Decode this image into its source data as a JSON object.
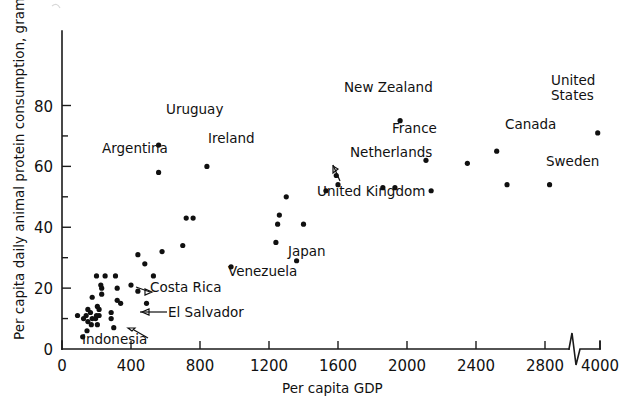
{
  "chart_data": {
    "type": "scatter",
    "title": "",
    "xlabel": "Per capita GDP",
    "ylabel": "Per capita daily animal protein consumption, grams",
    "xlim": [
      0,
      4000
    ],
    "ylim": [
      0,
      88
    ],
    "grid": false,
    "legend": "none",
    "axis_break": {
      "present": true,
      "between": [
        2900,
        3900
      ],
      "axis": "x"
    },
    "xticks": [
      0,
      400,
      800,
      1200,
      1600,
      2000,
      2400,
      2800,
      4000
    ],
    "xtick_labels": [
      "0",
      "400",
      "800",
      "1200",
      "1600",
      "2000",
      "2400",
      "2800",
      "4000"
    ],
    "yticks": [
      0,
      20,
      40,
      60,
      80
    ],
    "ytick_labels": [
      "0",
      "20",
      "40",
      "60",
      "80"
    ],
    "yminor_ticks": [
      10,
      30,
      50,
      70
    ],
    "points": [
      {
        "x": 1960,
        "y": 75,
        "label": "New Zealand",
        "label_pos": "right"
      },
      {
        "x": 3950,
        "y": 71,
        "label": "United States",
        "label_pos": "above"
      },
      {
        "x": 560,
        "y": 67,
        "label": "Uruguay",
        "label_pos": "right"
      },
      {
        "x": 2520,
        "y": 65,
        "label": "Canada",
        "label_pos": "right"
      },
      {
        "x": 840,
        "y": 60,
        "label": "Ireland",
        "label_pos": "right"
      },
      {
        "x": 2110,
        "y": 62,
        "label": "France",
        "label_pos": "left"
      },
      {
        "x": 2350,
        "y": 61,
        "label": "",
        "label_pos": ""
      },
      {
        "x": 560,
        "y": 58,
        "label": "Argentina",
        "label_pos": "left"
      },
      {
        "x": 1590,
        "y": 57,
        "label": "",
        "label_pos": ""
      },
      {
        "x": 1600,
        "y": 54,
        "label": "United Kingdom",
        "label_pos": "below"
      },
      {
        "x": 1860,
        "y": 53,
        "label": "Netherlands",
        "label_pos": "left"
      },
      {
        "x": 1930,
        "y": 53,
        "label": "",
        "label_pos": ""
      },
      {
        "x": 2580,
        "y": 54,
        "label": "",
        "label_pos": ""
      },
      {
        "x": 2900,
        "y": 54,
        "label": "Sweden",
        "label_pos": "right"
      },
      {
        "x": 1530,
        "y": 52,
        "label": "",
        "label_pos": ""
      },
      {
        "x": 2140,
        "y": 52,
        "label": "",
        "label_pos": ""
      },
      {
        "x": 1300,
        "y": 50,
        "label": "",
        "label_pos": ""
      },
      {
        "x": 1260,
        "y": 44,
        "label": "",
        "label_pos": ""
      },
      {
        "x": 760,
        "y": 43,
        "label": "",
        "label_pos": ""
      },
      {
        "x": 1250,
        "y": 41,
        "label": "",
        "label_pos": ""
      },
      {
        "x": 720,
        "y": 43,
        "label": "",
        "label_pos": ""
      },
      {
        "x": 1400,
        "y": 41,
        "label": "",
        "label_pos": ""
      },
      {
        "x": 1240,
        "y": 35,
        "label": "",
        "label_pos": ""
      },
      {
        "x": 700,
        "y": 34,
        "label": "",
        "label_pos": ""
      },
      {
        "x": 1360,
        "y": 29,
        "label": "Japan",
        "label_pos": "right"
      },
      {
        "x": 580,
        "y": 32,
        "label": "",
        "label_pos": ""
      },
      {
        "x": 440,
        "y": 31,
        "label": "",
        "label_pos": ""
      },
      {
        "x": 980,
        "y": 27,
        "label": "Venezuela",
        "label_pos": "below"
      },
      {
        "x": 480,
        "y": 28,
        "label": "",
        "label_pos": ""
      },
      {
        "x": 200,
        "y": 24,
        "label": "",
        "label_pos": ""
      },
      {
        "x": 250,
        "y": 24,
        "label": "",
        "label_pos": ""
      },
      {
        "x": 310,
        "y": 24,
        "label": "",
        "label_pos": ""
      },
      {
        "x": 530,
        "y": 24,
        "label": "",
        "label_pos": ""
      },
      {
        "x": 400,
        "y": 21,
        "label": "Costa Rica",
        "label_pos": "right"
      },
      {
        "x": 225,
        "y": 21,
        "label": "",
        "label_pos": ""
      },
      {
        "x": 230,
        "y": 20,
        "label": "",
        "label_pos": ""
      },
      {
        "x": 320,
        "y": 20,
        "label": "",
        "label_pos": ""
      },
      {
        "x": 440,
        "y": 19,
        "label": "",
        "label_pos": ""
      },
      {
        "x": 230,
        "y": 18,
        "label": "",
        "label_pos": ""
      },
      {
        "x": 175,
        "y": 17,
        "label": "",
        "label_pos": ""
      },
      {
        "x": 320,
        "y": 16,
        "label": "",
        "label_pos": ""
      },
      {
        "x": 340,
        "y": 15,
        "label": "",
        "label_pos": ""
      },
      {
        "x": 490,
        "y": 15,
        "label": "",
        "label_pos": ""
      },
      {
        "x": 205,
        "y": 14,
        "label": "",
        "label_pos": ""
      },
      {
        "x": 215,
        "y": 13,
        "label": "",
        "label_pos": ""
      },
      {
        "x": 150,
        "y": 13,
        "label": "",
        "label_pos": ""
      },
      {
        "x": 165,
        "y": 12,
        "label": "",
        "label_pos": ""
      },
      {
        "x": 285,
        "y": 12,
        "label": "",
        "label_pos": ""
      },
      {
        "x": 90,
        "y": 11,
        "label": "",
        "label_pos": ""
      },
      {
        "x": 140,
        "y": 11,
        "label": "",
        "label_pos": ""
      },
      {
        "x": 200,
        "y": 11,
        "label": "",
        "label_pos": ""
      },
      {
        "x": 215,
        "y": 11,
        "label": "",
        "label_pos": ""
      },
      {
        "x": 125,
        "y": 10,
        "label": "",
        "label_pos": ""
      },
      {
        "x": 175,
        "y": 10,
        "label": "",
        "label_pos": ""
      },
      {
        "x": 195,
        "y": 10,
        "label": "",
        "label_pos": ""
      },
      {
        "x": 285,
        "y": 10,
        "label": "El Salvador",
        "label_pos": "right"
      },
      {
        "x": 150,
        "y": 9,
        "label": "",
        "label_pos": ""
      },
      {
        "x": 170,
        "y": 8,
        "label": "",
        "label_pos": ""
      },
      {
        "x": 205,
        "y": 8,
        "label": "",
        "label_pos": ""
      },
      {
        "x": 300,
        "y": 7,
        "label": "",
        "label_pos": ""
      },
      {
        "x": 145,
        "y": 6,
        "label": "",
        "label_pos": ""
      },
      {
        "x": 120,
        "y": 4,
        "label": "Indonesia",
        "label_pos": "right"
      }
    ],
    "annotations": [
      {
        "text": "New Zealand",
        "x": 1960,
        "y": 75
      },
      {
        "text": "United States",
        "x": 3950,
        "y": 71
      },
      {
        "text": "Uruguay",
        "x": 560,
        "y": 67
      },
      {
        "text": "Canada",
        "x": 2520,
        "y": 65
      },
      {
        "text": "France",
        "x": 2110,
        "y": 62
      },
      {
        "text": "Ireland",
        "x": 840,
        "y": 60
      },
      {
        "text": "Argentina",
        "x": 560,
        "y": 58
      },
      {
        "text": "Netherlands",
        "x": 1860,
        "y": 53
      },
      {
        "text": "Sweden",
        "x": 2900,
        "y": 54
      },
      {
        "text": "United Kingdom",
        "x": 1600,
        "y": 54
      },
      {
        "text": "Japan",
        "x": 1360,
        "y": 29
      },
      {
        "text": "Venezuela",
        "x": 980,
        "y": 27
      },
      {
        "text": "Costa Rica",
        "x": 400,
        "y": 21
      },
      {
        "text": "El Salvador",
        "x": 285,
        "y": 10
      },
      {
        "text": "Indonesia",
        "x": 120,
        "y": 4
      }
    ]
  },
  "axis": {
    "x_title": "Per capita GDP",
    "y_title": "Per capita daily animal protein consumption, grams",
    "x_labels": [
      "0",
      "400",
      "800",
      "1200",
      "1600",
      "2000",
      "2400",
      "2800",
      "4000"
    ],
    "y_labels": [
      "0",
      "20",
      "40",
      "60",
      "80"
    ]
  },
  "labels": {
    "new_zealand": "New Zealand",
    "united_states_line1": "United",
    "united_states_line2": "States",
    "uruguay": "Uruguay",
    "canada": "Canada",
    "france": "France",
    "ireland": "Ireland",
    "argentina": "Argentina",
    "netherlands": "Netherlands",
    "sweden": "Sweden",
    "united_kingdom": "United Kingdom",
    "japan": "Japan",
    "venezuela": "Venezuela",
    "costa_rica": "Costa Rica",
    "el_salvador": "El Salvador",
    "indonesia": "Indonesia"
  },
  "style": {
    "ink": "#101010",
    "background": "#ffffff"
  }
}
